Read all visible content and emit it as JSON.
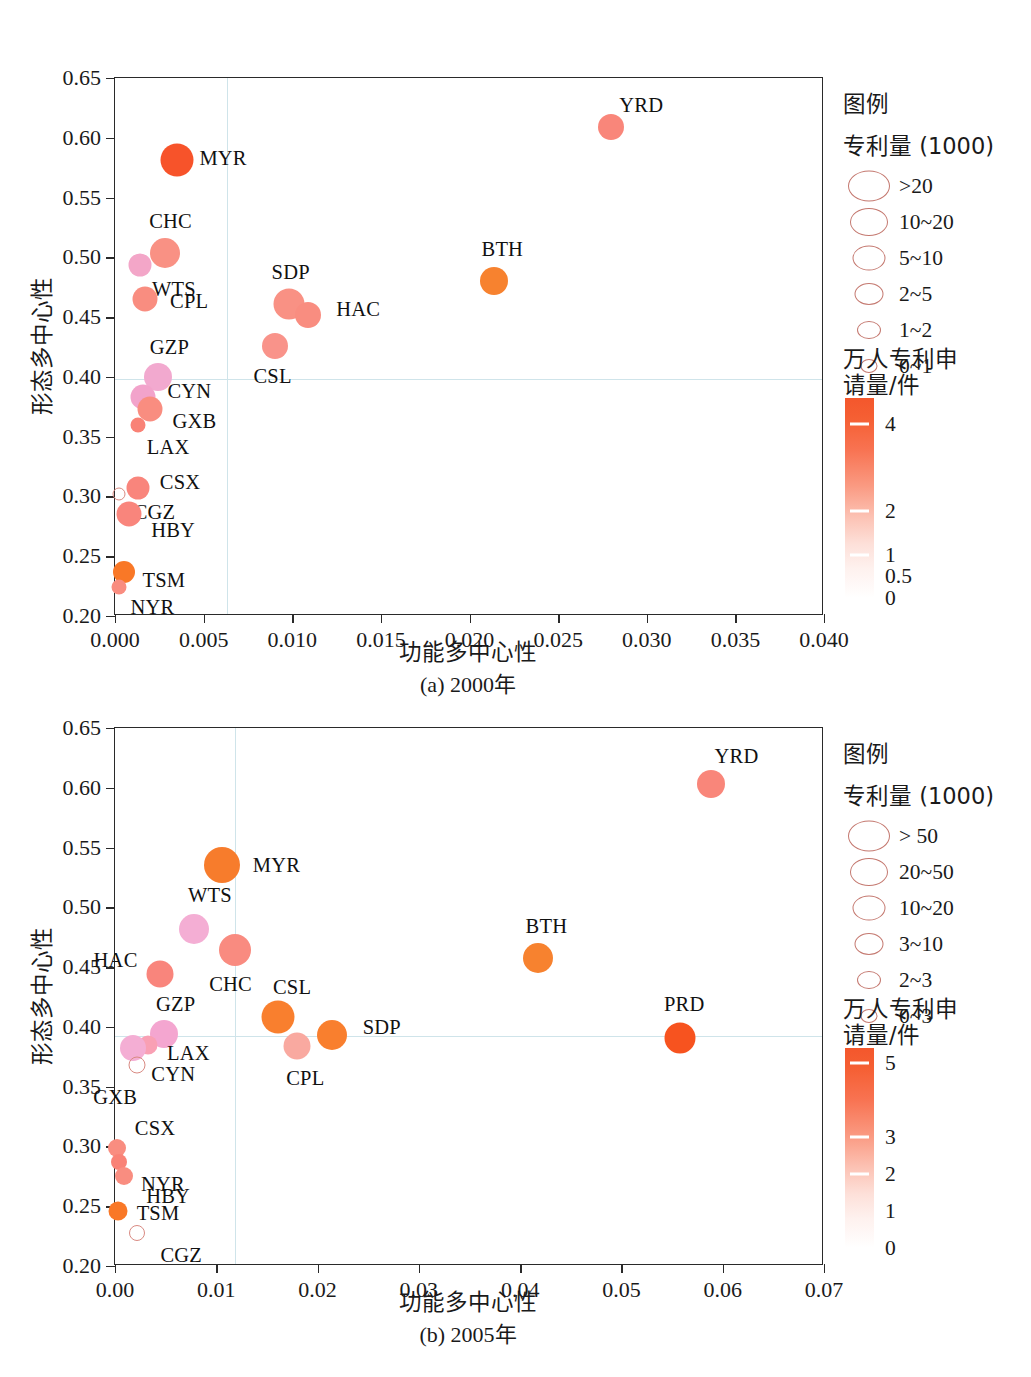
{
  "document": {
    "axis_title_x": "功能多中心性",
    "axis_title_y": "形态多中心性",
    "legend_title": "图例",
    "legend_size_title": "专利量 (1000)",
    "colorbar_title_line1": "万人专利申",
    "colorbar_title_line2": "请量/件"
  },
  "panel_a": {
    "caption": "(a) 2000年",
    "legend_size_labels": [
      ">20",
      "10~20",
      "5~10",
      "2~5",
      "1~2",
      "0~1"
    ],
    "colorbar_labels": [
      "4",
      "2",
      "1",
      "0.5",
      "0"
    ],
    "y_ticks": [
      "0.20",
      "0.25",
      "0.30",
      "0.35",
      "0.40",
      "0.45",
      "0.50",
      "0.55",
      "0.60",
      "0.65"
    ],
    "x_ticks": [
      "0.000",
      "0.005",
      "0.010",
      "0.015",
      "0.020",
      "0.025",
      "0.030",
      "0.035",
      "0.040"
    ]
  },
  "panel_b": {
    "caption": "(b) 2005年",
    "legend_size_labels": [
      "> 50",
      "20~50",
      "10~20",
      "3~10",
      "2~3",
      "0~3"
    ],
    "colorbar_labels": [
      "5",
      "3",
      "2",
      "1",
      "0"
    ],
    "y_ticks": [
      "0.20",
      "0.25",
      "0.30",
      "0.35",
      "0.40",
      "0.45",
      "0.50",
      "0.55",
      "0.60",
      "0.65"
    ],
    "x_ticks": [
      "0.00",
      "0.01",
      "0.02",
      "0.03",
      "0.04",
      "0.05",
      "0.06",
      "0.07"
    ]
  },
  "chart_data": [
    {
      "type": "scatter",
      "id": "panel_a",
      "title": "(a) 2000年",
      "xlabel": "功能多中心性",
      "ylabel": "形态多中心性",
      "xlim": [
        0.0,
        0.04
      ],
      "ylim": [
        0.2,
        0.65
      ],
      "xticks": [
        0.0,
        0.005,
        0.01,
        0.015,
        0.02,
        0.025,
        0.03,
        0.035,
        0.04
      ],
      "yticks": [
        0.2,
        0.25,
        0.3,
        0.35,
        0.4,
        0.45,
        0.5,
        0.55,
        0.6,
        0.65
      ],
      "grid": "reference lines at x=0.0063 and y=0.398",
      "reference_x": 0.0063,
      "reference_y": 0.398,
      "size_legend_title": "专利量 (1000)",
      "size_legend": [
        ">20",
        "10~20",
        "5~10",
        "2~5",
        "1~2",
        "0~1"
      ],
      "colorbar_title": "万人专利申请量/件",
      "colorbar_ticks": [
        4,
        2,
        1,
        0.5,
        0
      ],
      "colorbar_range": [
        0,
        4.6
      ],
      "points": [
        {
          "label": "YRD",
          "x": 0.028,
          "y": 0.609,
          "size_px": 26,
          "color": "#f9867a",
          "label_dx": 30,
          "label_dy": -22
        },
        {
          "label": "MYR",
          "x": 0.0035,
          "y": 0.581,
          "size_px": 33,
          "color": "#f7532a",
          "label_dx": 46,
          "label_dy": -2
        },
        {
          "label": "CHC",
          "x": 0.0028,
          "y": 0.504,
          "size_px": 30,
          "color": "#f99184",
          "label_dx": 6,
          "label_dy": -32
        },
        {
          "label": "WTS",
          "x": 0.0014,
          "y": 0.494,
          "size_px": 23,
          "color": "#f3a6c8",
          "label_dx": 34,
          "label_dy": 24
        },
        {
          "label": "CPL",
          "x": 0.0017,
          "y": 0.465,
          "size_px": 25,
          "color": "#f98d80",
          "label_dx": 44,
          "label_dy": 2
        },
        {
          "label": "SDP",
          "x": 0.0098,
          "y": 0.461,
          "size_px": 31,
          "color": "#f99184",
          "label_dx": 2,
          "label_dy": -32
        },
        {
          "label": "HAC",
          "x": 0.0109,
          "y": 0.452,
          "size_px": 26,
          "color": "#f98d80",
          "label_dx": 50,
          "label_dy": -6
        },
        {
          "label": "BTH",
          "x": 0.0214,
          "y": 0.48,
          "size_px": 28,
          "color": "#f7822f",
          "label_dx": 8,
          "label_dy": -32
        },
        {
          "label": "CSL",
          "x": 0.009,
          "y": 0.426,
          "size_px": 26,
          "color": "#f9938a",
          "label_dx": -2,
          "label_dy": 30
        },
        {
          "label": "GZP",
          "x": 0.0024,
          "y": 0.4,
          "size_px": 28,
          "color": "#f2a9cf",
          "label_dx": 12,
          "label_dy": -30
        },
        {
          "label": "CYN",
          "x": 0.0016,
          "y": 0.383,
          "size_px": 25,
          "color": "#f2a3cb",
          "label_dx": 46,
          "label_dy": -6
        },
        {
          "label": "GXB",
          "x": 0.002,
          "y": 0.373,
          "size_px": 25,
          "color": "#f98d80",
          "label_dx": 44,
          "label_dy": 12
        },
        {
          "label": "LAX",
          "x": 0.0013,
          "y": 0.36,
          "size_px": 15,
          "color": "#f98276",
          "label_dx": 30,
          "label_dy": 22
        },
        {
          "label": "CSX",
          "x": 0.0013,
          "y": 0.307,
          "size_px": 23,
          "color": "#f9857c",
          "label_dx": 42,
          "label_dy": -6
        },
        {
          "label": "CGZ",
          "x": 0.0002,
          "y": 0.302,
          "size_px": 13,
          "color": "#ffffff",
          "hollow": true,
          "label_dx": 36,
          "label_dy": 18
        },
        {
          "label": "HBY",
          "x": 0.0008,
          "y": 0.285,
          "size_px": 25,
          "color": "#f9857c",
          "label_dx": 44,
          "label_dy": 16
        },
        {
          "label": "TSM",
          "x": 0.0005,
          "y": 0.237,
          "size_px": 22,
          "color": "#f97827",
          "label_dx": 40,
          "label_dy": 8
        },
        {
          "label": "NYR",
          "x": 0.0002,
          "y": 0.224,
          "size_px": 15,
          "color": "#f98d80",
          "label_dx": 34,
          "label_dy": 20
        }
      ]
    },
    {
      "type": "scatter",
      "id": "panel_b",
      "title": "(b) 2005年",
      "xlabel": "功能多中心性",
      "ylabel": "形态多中心性",
      "xlim": [
        0.0,
        0.07
      ],
      "ylim": [
        0.2,
        0.65
      ],
      "xticks": [
        0.0,
        0.01,
        0.02,
        0.03,
        0.04,
        0.05,
        0.06,
        0.07
      ],
      "yticks": [
        0.2,
        0.25,
        0.3,
        0.35,
        0.4,
        0.45,
        0.5,
        0.55,
        0.6,
        0.65
      ],
      "grid": "reference lines at x=0.0118 and y=0.392",
      "reference_x": 0.0118,
      "reference_y": 0.392,
      "size_legend_title": "专利量 (1000)",
      "size_legend": [
        "> 50",
        "20~50",
        "10~20",
        "3~10",
        "2~3",
        "0~3"
      ],
      "colorbar_title": "万人专利申请量/件",
      "colorbar_ticks": [
        5,
        3,
        2,
        1,
        0
      ],
      "colorbar_range": [
        0,
        5.4
      ],
      "points": [
        {
          "label": "YRD",
          "x": 0.0588,
          "y": 0.603,
          "size_px": 28,
          "color": "#f9867a",
          "label_dx": 26,
          "label_dy": -28
        },
        {
          "label": "MYR",
          "x": 0.0106,
          "y": 0.535,
          "size_px": 36,
          "color": "#f77c2c",
          "label_dx": 54,
          "label_dy": 0
        },
        {
          "label": "WTS",
          "x": 0.0078,
          "y": 0.482,
          "size_px": 30,
          "color": "#f4aed4",
          "label_dx": 16,
          "label_dy": -34
        },
        {
          "label": "CHC",
          "x": 0.0118,
          "y": 0.464,
          "size_px": 32,
          "color": "#f98b80",
          "label_dx": -4,
          "label_dy": 34
        },
        {
          "label": "BTH",
          "x": 0.0418,
          "y": 0.458,
          "size_px": 30,
          "color": "#f7822f",
          "label_dx": 8,
          "label_dy": -32
        },
        {
          "label": "HAC",
          "x": 0.0044,
          "y": 0.444,
          "size_px": 27,
          "color": "#f9857c",
          "label_dx": -44,
          "label_dy": -14
        },
        {
          "label": "CSL",
          "x": 0.0161,
          "y": 0.408,
          "size_px": 33,
          "color": "#f97f2e",
          "label_dx": 14,
          "label_dy": -30
        },
        {
          "label": "GZP",
          "x": 0.0048,
          "y": 0.394,
          "size_px": 28,
          "color": "#f4a6d0",
          "label_dx": 12,
          "label_dy": -30
        },
        {
          "label": "SDP",
          "x": 0.0214,
          "y": 0.393,
          "size_px": 30,
          "color": "#f97f2e",
          "label_dx": 50,
          "label_dy": -8
        },
        {
          "label": "PRD",
          "x": 0.0558,
          "y": 0.391,
          "size_px": 31,
          "color": "#f7531f",
          "label_dx": 4,
          "label_dy": -34
        },
        {
          "label": "LAX",
          "x": 0.0033,
          "y": 0.385,
          "size_px": 19,
          "color": "#f9a0b4",
          "label_dx": 40,
          "label_dy": 8
        },
        {
          "label": "CPL",
          "x": 0.018,
          "y": 0.384,
          "size_px": 27,
          "color": "#f9a9a0",
          "label_dx": 8,
          "label_dy": 32
        },
        {
          "label": "CYN",
          "x": 0.0018,
          "y": 0.382,
          "size_px": 26,
          "color": "#f4aed4",
          "label_dx": 40,
          "label_dy": 26
        },
        {
          "label": "GXB",
          "x": 0.0022,
          "y": 0.368,
          "size_px": 17,
          "color": "#ffffff",
          "hollow": true,
          "label_dx": -22,
          "label_dy": 32
        },
        {
          "label": "CSX",
          "x": 0.0002,
          "y": 0.299,
          "size_px": 18,
          "color": "#f98d80",
          "label_dx": 38,
          "label_dy": -20
        },
        {
          "label": "NYR",
          "x": 0.0004,
          "y": 0.287,
          "size_px": 16,
          "color": "#f98276",
          "label_dx": 44,
          "label_dy": 22
        },
        {
          "label": "HBY",
          "x": 0.0009,
          "y": 0.275,
          "size_px": 18,
          "color": "#f98d80",
          "label_dx": 44,
          "label_dy": 20
        },
        {
          "label": "TSM",
          "x": 0.0003,
          "y": 0.246,
          "size_px": 19,
          "color": "#f97827",
          "label_dx": 40,
          "label_dy": 2
        },
        {
          "label": "CGZ",
          "x": 0.0022,
          "y": 0.228,
          "size_px": 16,
          "color": "#ffffff",
          "hollow": true,
          "label_dx": 44,
          "label_dy": 22
        }
      ]
    }
  ]
}
